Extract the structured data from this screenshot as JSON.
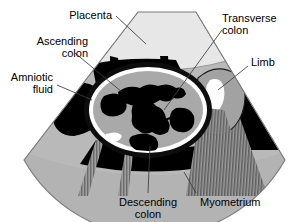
{
  "figure": {
    "type": "obstetric-ultrasound-diagram",
    "modality": "ultrasound sector scan",
    "width": 307,
    "height": 222
  },
  "labels": {
    "placenta": "Placenta",
    "ascending_colon_line1": "Ascending",
    "ascending_colon_line2": "colon",
    "amniotic_fluid_line1": "Amniotic",
    "amniotic_fluid_line2": "fluid",
    "transverse_colon_line1": "Transverse",
    "transverse_colon_line2": "colon",
    "limb": "Limb",
    "descending_colon_line1": "Descending",
    "descending_colon_line2": "colon",
    "myometrium": "Myometrium"
  },
  "structures": [
    {
      "name": "placenta",
      "label": "Placenta",
      "tone": "light-gray",
      "region": "top band of sector"
    },
    {
      "name": "ascending-colon",
      "label": "Ascending colon",
      "tone": "black",
      "region": "left of fetal abdomen"
    },
    {
      "name": "amniotic-fluid",
      "label": "Amniotic fluid",
      "tone": "black",
      "region": "left and right anechoic areas"
    },
    {
      "name": "transverse-colon",
      "label": "Transverse colon",
      "tone": "black",
      "region": "center of fetal abdomen"
    },
    {
      "name": "limb",
      "label": "Limb",
      "tone": "bright-white",
      "region": "right, casting acoustic shadow"
    },
    {
      "name": "descending-colon",
      "label": "Descending colon",
      "tone": "black",
      "region": "lower fetal abdomen"
    },
    {
      "name": "myometrium",
      "label": "Myometrium",
      "tone": "mid-gray",
      "region": "outer arc band of sector"
    },
    {
      "name": "fetal-abdomen-wall",
      "label": "Fetal abdomen",
      "tone": "white ellipse ring",
      "region": "center"
    },
    {
      "name": "acoustic-shadow",
      "label": "Acoustic shadow",
      "tone": "striped gray",
      "region": "below limb and below abdomen"
    }
  ],
  "colors": {
    "background": "#ffffff",
    "placenta": "#e6e6e6",
    "uterus_gray": "#b8b8b8",
    "myometrium": "#b0b0b0",
    "abdomen_fill": "#a8a8a8",
    "abdomen_ring": "#ffffff",
    "bowel_black": "#000000",
    "fluid_black": "#000000",
    "limb_white": "#ffffff",
    "shadow_stripe": "#6e6e6e",
    "outline": "#1a1a1a",
    "leader_line": "#3a3a3a",
    "text": "#000000"
  }
}
